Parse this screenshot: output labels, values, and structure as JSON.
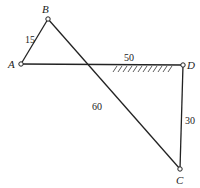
{
  "diagram": {
    "type": "mechanism-linkage",
    "points": {
      "A": {
        "label": "A",
        "x": 21,
        "y": 64
      },
      "B": {
        "label": "B",
        "x": 48,
        "y": 19
      },
      "C": {
        "label": "C",
        "x": 180,
        "y": 169
      },
      "D": {
        "label": "D",
        "x": 183,
        "y": 65
      }
    },
    "links": [
      {
        "id": "AB",
        "length_label": "15"
      },
      {
        "id": "AD",
        "length_label": "50"
      },
      {
        "id": "BC",
        "length_label": "60"
      },
      {
        "id": "CD",
        "length_label": "30"
      }
    ],
    "ground": {
      "link": "AD",
      "hatch": true
    }
  }
}
